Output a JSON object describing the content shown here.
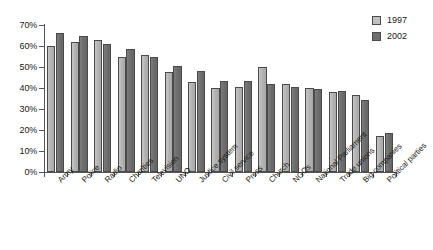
{
  "chart_data": {
    "type": "bar",
    "title": "",
    "xlabel": "",
    "ylabel": "",
    "ylim": [
      0,
      70
    ],
    "ytick_labels": [
      "70%",
      "60%",
      "50%",
      "40%",
      "30%",
      "20%",
      "10%",
      "0%"
    ],
    "ytick_values": [
      70,
      60,
      50,
      40,
      30,
      20,
      10,
      0
    ],
    "grid": false,
    "legend_position": "top-right",
    "categories": [
      "Army",
      "Police",
      "Radio",
      "Charities",
      "Television",
      "UNO",
      "Justice system",
      "Civil service",
      "Press",
      "Church",
      "NGOs",
      "National Parliament",
      "Trade unions",
      "Big companies",
      "Political parties"
    ],
    "series": [
      {
        "name": "1997",
        "color": "#b4b4b4",
        "values": [
          60,
          62,
          63,
          55,
          55.5,
          47.5,
          43,
          40,
          40.5,
          50,
          42,
          40,
          38,
          36.5,
          17
        ]
      },
      {
        "name": "2002",
        "color": "#6e6e6e",
        "values": [
          66,
          65,
          61,
          58.5,
          55,
          50.5,
          48,
          43.5,
          43.5,
          42,
          40.5,
          39.5,
          38.5,
          34.5,
          18.5
        ]
      }
    ]
  },
  "legend": {
    "items": [
      {
        "label": "1997",
        "swatch": "s1997"
      },
      {
        "label": "2002",
        "swatch": "s2002"
      }
    ]
  }
}
